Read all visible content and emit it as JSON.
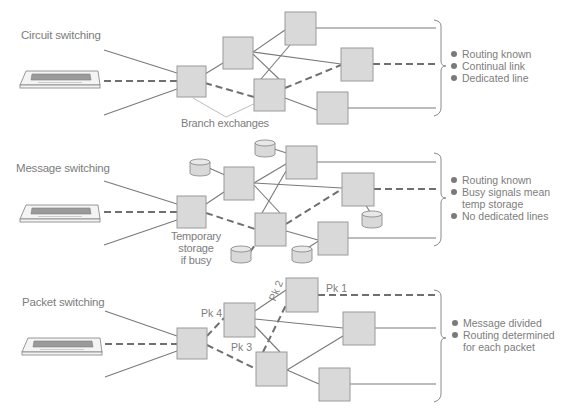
{
  "panels": {
    "circuit": {
      "title": "Circuit switching",
      "annotation": "Branch exchanges",
      "notes": [
        "Routing known",
        "Continual link",
        "Dedicated line"
      ]
    },
    "message": {
      "title": "Message switching",
      "annotation": "Temporary storage if busy",
      "annotation_lines": [
        "Temporary",
        "storage",
        "if busy"
      ],
      "notes": [
        "Routing known",
        "Busy signals mean temp storage",
        "No dedicated lines"
      ],
      "notes_lines": [
        "Routing known",
        "Busy signals mean",
        "temp storage",
        "No dedicated lines"
      ]
    },
    "packet": {
      "title": "Packet switching",
      "packet_labels": [
        "Pk 1",
        "Pk 2",
        "Pk 3",
        "Pk 4"
      ],
      "notes": [
        "Message divided",
        "Routing determined for each packet"
      ],
      "notes_lines": [
        "Message divided",
        "Routing determined",
        "for each packet"
      ]
    }
  },
  "icons": {
    "terminal": "keyboard-terminal-icon",
    "exchange": "square-node",
    "storage": "cylinder-storage-icon"
  },
  "colors": {
    "node_fill": "#d9d9d9",
    "line": "#7a7a7a",
    "text": "#7d7d7d",
    "background": "#ffffff"
  }
}
